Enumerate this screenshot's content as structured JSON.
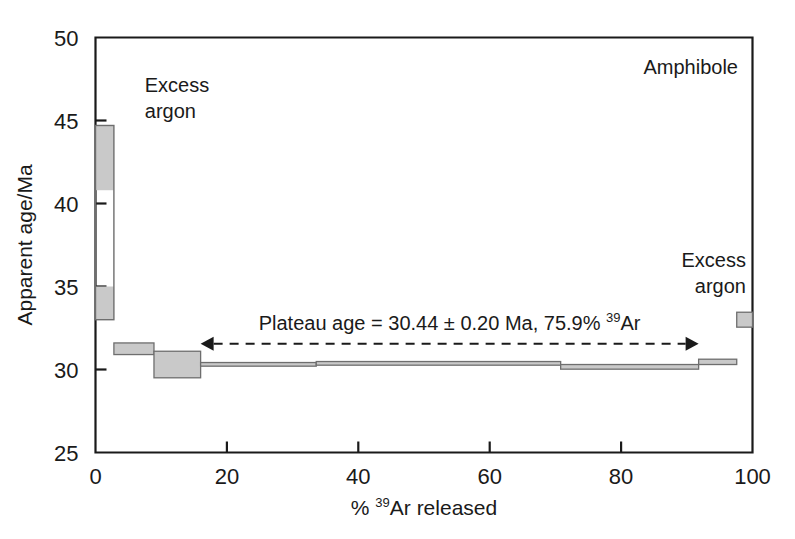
{
  "chart_data": {
    "type": "bar",
    "subtype": "ar-ar-age-spectrum",
    "title": "",
    "sample_label": "Amphibole",
    "xlabel": "% ³⁹Ar released",
    "xlabel_parts": {
      "pre": "% ",
      "sup": "39",
      "post": "Ar released"
    },
    "ylabel": "Apparent age/Ma",
    "xlim": [
      0,
      100
    ],
    "ylim": [
      25,
      50
    ],
    "xticks": [
      0,
      20,
      40,
      60,
      80,
      100
    ],
    "yticks": [
      25,
      30,
      35,
      40,
      45,
      50
    ],
    "grid": false,
    "legend": false,
    "box_fill": "#c9c9c9",
    "box_edge": "#6e6e6e",
    "axis_color": "#1a1a1a",
    "steps": [
      {
        "x_start": 0.0,
        "x_end": 2.8,
        "age_low": 33.0,
        "age_high": 44.7,
        "split": true,
        "gray_top_to": 40.8,
        "gray_bottom_from": 35.0,
        "label": "step-1"
      },
      {
        "x_start": 2.8,
        "x_end": 8.9,
        "age_low": 30.9,
        "age_high": 31.6,
        "label": "step-2"
      },
      {
        "x_start": 8.9,
        "x_end": 16.0,
        "age_low": 29.5,
        "age_high": 31.1,
        "label": "step-3"
      },
      {
        "x_start": 16.0,
        "x_end": 33.6,
        "age_low": 30.2,
        "age_high": 30.42,
        "label": "step-4"
      },
      {
        "x_start": 33.6,
        "x_end": 70.8,
        "age_low": 30.26,
        "age_high": 30.48,
        "label": "step-5"
      },
      {
        "x_start": 70.8,
        "x_end": 91.8,
        "age_low": 30.02,
        "age_high": 30.3,
        "label": "step-6"
      },
      {
        "x_start": 91.8,
        "x_end": 97.6,
        "age_low": 30.3,
        "age_high": 30.62,
        "label": "step-7"
      },
      {
        "x_start": 97.6,
        "x_end": 100.0,
        "age_low": 32.55,
        "age_high": 33.45,
        "label": "step-8"
      }
    ],
    "annotations": [
      {
        "name": "excess-argon-left",
        "text_lines": [
          "Excess",
          "argon"
        ],
        "x": 7.5,
        "y": 46.7
      },
      {
        "name": "excess-argon-right",
        "text_lines": [
          "Excess",
          "argon"
        ],
        "x": 99.0,
        "y": 36.2
      },
      {
        "name": "plateau-annotation",
        "text": "Plateau age = 30.44 ± 0.20 Ma,  75.9% ³⁹Ar",
        "text_parts": {
          "pre": "Plateau age = 30.44 ± 0.20 Ma,  75.9% ",
          "sup": "39",
          "post": "Ar"
        },
        "arrow_x_start": 16.0,
        "arrow_x_end": 91.8,
        "arrow_y": 31.55,
        "style": "double-headed-dashed-arrow"
      }
    ]
  }
}
